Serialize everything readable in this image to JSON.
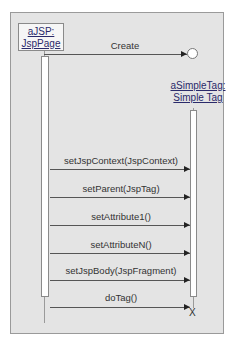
{
  "diagram": {
    "type": "UML sequence diagram",
    "objects": [
      {
        "line1": "aJSP:",
        "line2": "JspPage"
      },
      {
        "line1": "aSimpleTag:",
        "line2": "Simple Tag"
      }
    ],
    "create_message": "Create",
    "messages": [
      "setJspContext(JspContext)",
      "setParent(JspTag)",
      "setAttribute1()",
      "setAttributeN()",
      "setJspBody(JspFragment)",
      "doTag()"
    ],
    "destroy_marker": "X"
  }
}
